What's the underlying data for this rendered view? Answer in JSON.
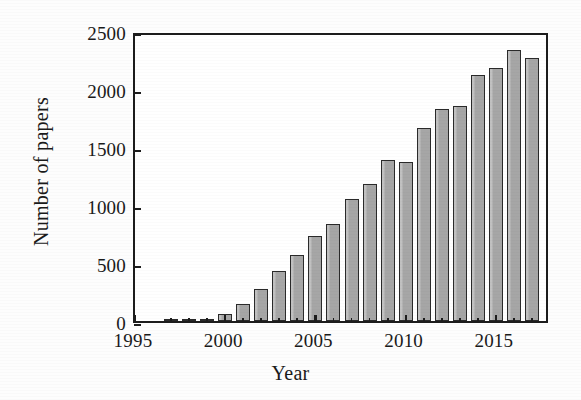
{
  "chart_data": {
    "type": "bar",
    "title": "",
    "xlabel": "Year",
    "ylabel": "Number of papers",
    "categories": [
      1997,
      1998,
      1999,
      2000,
      2001,
      2002,
      2003,
      2004,
      2005,
      2006,
      2007,
      2008,
      2009,
      2010,
      2011,
      2012,
      2013,
      2014,
      2015,
      2016,
      2017
    ],
    "values": [
      5,
      12,
      15,
      60,
      145,
      275,
      430,
      565,
      735,
      840,
      1050,
      1180,
      1390,
      1375,
      1660,
      1830,
      1855,
      2120,
      2180,
      2335,
      2265
    ],
    "xlim": [
      1995,
      2018
    ],
    "ylim": [
      0,
      2500
    ],
    "ytick_labels": [
      "0",
      "500",
      "1000",
      "1500",
      "2000",
      "2500"
    ],
    "ytick_values": [
      0,
      500,
      1000,
      1500,
      2000,
      2500
    ],
    "xtick_labels": [
      "1995",
      "2000",
      "2005",
      "2010",
      "2015"
    ],
    "xtick_values": [
      1995,
      2000,
      2005,
      2010,
      2015
    ],
    "grid": false,
    "legend": null,
    "bar_color": "#a6a6a6",
    "bar_edge_color": "#2a2a2a",
    "axis_color": "#1c1c1c",
    "background_color": "#ffffff"
  }
}
